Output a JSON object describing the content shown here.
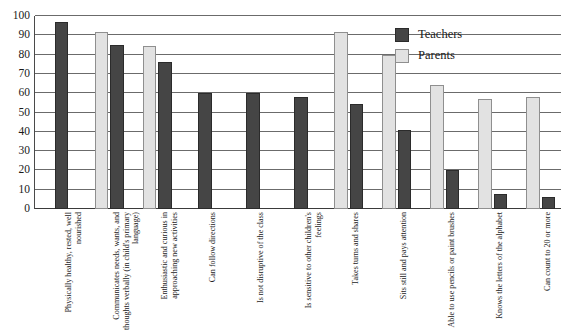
{
  "chart_data": {
    "type": "bar",
    "title": "",
    "xlabel": "",
    "ylabel": "",
    "ylim": [
      0,
      100
    ],
    "ytick_step": 10,
    "yticks": [
      100,
      90,
      80,
      70,
      60,
      50,
      40,
      30,
      20,
      10,
      0
    ],
    "grid": true,
    "legend_position": "top-right",
    "orientation": "vertical",
    "categories": [
      "Physically healthy, rested, well nourished",
      "Communicates needs, wants, and thoughts verbally (in child's primary language)",
      "Enthusiastic and curious in approaching new activities",
      "Can follow directions",
      "Is not disruptive of the class",
      "Is sensitive to other children's feelings",
      "Takes turns and shares",
      "Sits still and pays attention",
      "Able to use pencils or paint brushes",
      "Knows the letters of the alphabet",
      "Can count to 20 or more"
    ],
    "series": [
      {
        "name": "Parents",
        "color": "#e2e2e2",
        "values": [
          null,
          91.5,
          84.5,
          null,
          null,
          null,
          91.5,
          80,
          64,
          57,
          58
        ]
      },
      {
        "name": "Teachers",
        "color": "#454545",
        "values": [
          97,
          85,
          76,
          60,
          60,
          58,
          54.5,
          41,
          20,
          8,
          6
        ]
      }
    ]
  },
  "legend": {
    "items": [
      {
        "label": "Teachers",
        "key": "teachers"
      },
      {
        "label": "Parents",
        "key": "parents"
      }
    ]
  }
}
